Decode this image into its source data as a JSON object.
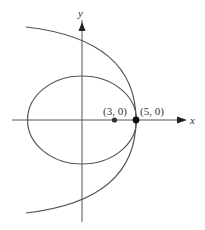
{
  "figure": {
    "axes": {
      "x_label": "x",
      "y_label": "y"
    },
    "curves": [
      {
        "type": "ellipse",
        "name": "ellipse",
        "center": [
          0,
          0
        ],
        "vertex_right": [
          5,
          0
        ],
        "focus": [
          3,
          0
        ]
      },
      {
        "type": "parabola",
        "name": "parabola",
        "vertex": [
          5,
          0
        ],
        "opens": "left"
      }
    ],
    "points": [
      {
        "label": "(3, 0)",
        "x": 3,
        "y": 0
      },
      {
        "label": "(5, 0)",
        "x": 5,
        "y": 0
      }
    ],
    "colors": {
      "stroke": "#555555",
      "point": "#111111"
    }
  }
}
